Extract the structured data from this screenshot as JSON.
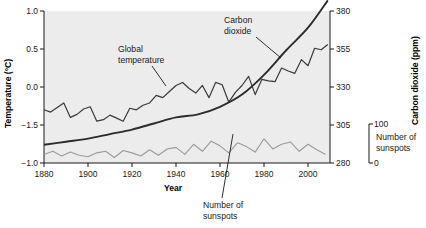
{
  "chart_data": {
    "type": "line",
    "title": "",
    "xlabel": "Year",
    "ylabel": "Temperature (°C)",
    "y2label": "Carbon dioxide (ppm)",
    "y3label": "Number of sunspots",
    "grid": false,
    "legend": "annotations",
    "plot_background": "#ececec",
    "xlim": [
      1880,
      2010
    ],
    "xticks": [
      1880,
      1900,
      1920,
      1940,
      1960,
      1980,
      2000
    ],
    "xticklabels": [
      "1880",
      "1900",
      "1920",
      "1940",
      "1960",
      "1980",
      "2000"
    ],
    "ylim": [
      -1.0,
      1.0
    ],
    "yticks": [
      1.0,
      0.5,
      0.0,
      -1.5,
      -1.0
    ],
    "yticklabels": [
      "1.0",
      "0.5",
      "0.0",
      "−1.5",
      "−1.0"
    ],
    "y2lim": [
      280,
      380
    ],
    "y2ticks": [
      380,
      355,
      330,
      305,
      280
    ],
    "y2ticklabels": [
      "380",
      "355",
      "330",
      "305",
      "280"
    ],
    "y3lim": [
      0,
      100
    ],
    "y3ticks": [
      100,
      0
    ],
    "y3ticklabels": [
      "100",
      "0"
    ],
    "series": [
      {
        "name": "Global temperature",
        "color": "#3a3a3a",
        "axis": "left",
        "annotation": "Global temperature",
        "x": [
          1880,
          1883,
          1886,
          1889,
          1892,
          1895,
          1898,
          1901,
          1904,
          1907,
          1910,
          1913,
          1916,
          1919,
          1922,
          1925,
          1928,
          1931,
          1934,
          1937,
          1940,
          1943,
          1946,
          1949,
          1952,
          1955,
          1958,
          1961,
          1964,
          1967,
          1970,
          1973,
          1976,
          1979,
          1982,
          1985,
          1988,
          1991,
          1994,
          1997,
          2000,
          2003,
          2006,
          2009
        ],
        "values": [
          -0.3,
          -0.33,
          -0.27,
          -0.21,
          -0.4,
          -0.36,
          -0.29,
          -0.26,
          -0.45,
          -0.43,
          -0.37,
          -0.41,
          -0.45,
          -0.28,
          -0.3,
          -0.24,
          -0.21,
          -0.11,
          -0.14,
          -0.06,
          0.02,
          0.06,
          -0.02,
          -0.08,
          0.02,
          -0.14,
          0.06,
          0.03,
          -0.2,
          -0.07,
          0.02,
          0.14,
          -0.1,
          0.1,
          0.08,
          0.07,
          0.25,
          0.21,
          0.18,
          0.36,
          0.28,
          0.51,
          0.49,
          0.56
        ]
      },
      {
        "name": "Carbon dioxide",
        "color": "#2b2b2b",
        "axis": "right",
        "annotation": "Carbon dioxide",
        "x": [
          1880,
          1890,
          1900,
          1910,
          1920,
          1930,
          1940,
          1950,
          1960,
          1970,
          1980,
          1990,
          2000,
          2009
        ],
        "values": [
          292,
          294,
          296,
          299,
          302,
          306,
          310,
          312,
          317,
          325,
          338,
          354,
          369,
          387
        ]
      },
      {
        "name": "Number of sunspots",
        "color": "#9a9a9a",
        "axis": "sunspots",
        "annotation": "Number of sunspots",
        "x": [
          1880,
          1884,
          1888,
          1892,
          1896,
          1900,
          1904,
          1908,
          1912,
          1916,
          1920,
          1924,
          1928,
          1932,
          1936,
          1940,
          1944,
          1948,
          1952,
          1956,
          1960,
          1964,
          1968,
          1972,
          1976,
          1980,
          1984,
          1988,
          1992,
          1996,
          2000,
          2004,
          2008
        ],
        "values": [
          22,
          30,
          18,
          28,
          20,
          16,
          26,
          30,
          14,
          32,
          26,
          18,
          34,
          20,
          36,
          40,
          22,
          48,
          30,
          56,
          44,
          26,
          52,
          42,
          28,
          62,
          36,
          48,
          54,
          30,
          48,
          34,
          22
        ]
      }
    ],
    "annotations": [
      {
        "text": "Global temperature",
        "target": "Global temperature"
      },
      {
        "text": "Carbon dioxide",
        "target": "Carbon dioxide"
      },
      {
        "text": "Number of sunspots",
        "target": "Number of sunspots"
      }
    ]
  },
  "axes": {
    "left_title": "Temperature (°C)",
    "right_title": "Carbon dioxide (ppm)",
    "bottom_title": "Year",
    "sunspot_title_line1": "Number of",
    "sunspot_title_line2": "sunspots"
  },
  "labels": {
    "annot_global_line1": "Global",
    "annot_global_line2": "temperature",
    "annot_co2_line1": "Carbon",
    "annot_co2_line2": "dioxide",
    "annot_sunspots_line1": "Number of",
    "annot_sunspots_line2": "sunspots"
  },
  "caption": {
    "text": ""
  }
}
